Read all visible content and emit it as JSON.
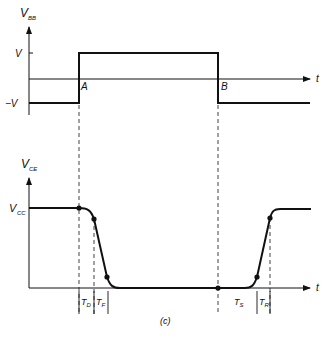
{
  "figure_label": "(c)",
  "top_plot": {
    "y_axis_label": "V",
    "y_axis_sub": "BB",
    "x_axis_label": "t",
    "levels": {
      "high": "V",
      "low": "−V"
    },
    "points": {
      "A": "A",
      "B": "B"
    }
  },
  "bottom_plot": {
    "y_axis_label": "V",
    "y_axis_sub": "CE",
    "x_axis_label": "t",
    "level_label": "V",
    "level_sub": "CC",
    "intervals": [
      {
        "main": "T",
        "sub": "D"
      },
      {
        "main": "T",
        "sub": "F"
      },
      {
        "main": "T",
        "sub": "S"
      },
      {
        "main": "T",
        "sub": "R"
      }
    ]
  },
  "colors": {
    "line": "#111111",
    "background": "#ffffff"
  }
}
